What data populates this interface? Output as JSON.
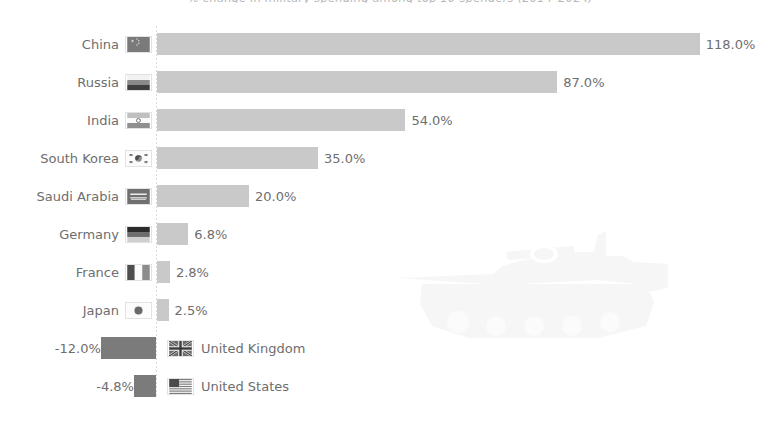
{
  "chart_title": "% change in military spending among top 10 spenders (2014–2024)",
  "watermark": {
    "icon": "tank-silhouette",
    "color": "#e8e8e8"
  },
  "colors": {
    "positive_bar": "#c9c9c9",
    "negative_bar": "#7b7b7b",
    "axis": "#d8d8d8",
    "text": "#6e6e6e",
    "title_text": "#b9b9b9",
    "background": "#ffffff"
  },
  "chart_data": {
    "type": "bar",
    "orientation": "horizontal",
    "title": "% change in military spending among top 10 spenders (2014–2024)",
    "xlabel": "",
    "ylabel": "",
    "grid": false,
    "legend": false,
    "unit": "%",
    "zero_baseline": true,
    "xlim": [
      -20,
      130
    ],
    "categories": [
      "China",
      "Russia",
      "India",
      "South Korea",
      "Saudi Arabia",
      "Germany",
      "France",
      "Japan",
      "United Kingdom",
      "United States"
    ],
    "values": [
      118.0,
      87.0,
      54.0,
      35.0,
      20.0,
      6.8,
      2.8,
      2.5,
      -12.0,
      -4.8
    ],
    "value_labels": [
      "118.0%",
      "87.0%",
      "54.0%",
      "35.0%",
      "20.0%",
      "6.8%",
      "2.8%",
      "2.5%",
      "-12.0%",
      "-4.8%"
    ],
    "flags": [
      "china-flag",
      "russia-flag",
      "india-flag",
      "south-korea-flag",
      "saudi-arabia-flag",
      "germany-flag",
      "france-flag",
      "japan-flag",
      "united-kingdom-flag",
      "united-states-flag"
    ]
  },
  "rows": [
    {
      "label": "China",
      "value": "118.0%",
      "flag": "china-flag"
    },
    {
      "label": "Russia",
      "value": "87.0%",
      "flag": "russia-flag"
    },
    {
      "label": "India",
      "value": "54.0%",
      "flag": "india-flag"
    },
    {
      "label": "South Korea",
      "value": "35.0%",
      "flag": "south-korea-flag"
    },
    {
      "label": "Saudi Arabia",
      "value": "20.0%",
      "flag": "saudi-arabia-flag"
    },
    {
      "label": "Germany",
      "value": "6.8%",
      "flag": "germany-flag"
    },
    {
      "label": "France",
      "value": "2.8%",
      "flag": "france-flag"
    },
    {
      "label": "Japan",
      "value": "2.5%",
      "flag": "japan-flag"
    },
    {
      "label": "United Kingdom",
      "value": "-12.0%",
      "flag": "united-kingdom-flag"
    },
    {
      "label": "United States",
      "value": "-4.8%",
      "flag": "united-states-flag"
    }
  ]
}
